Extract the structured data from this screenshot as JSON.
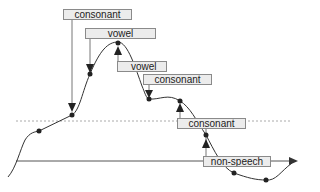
{
  "diagram": {
    "type": "pitch contour with segment labels",
    "labels": [
      {
        "text": "consonant",
        "x": 63,
        "y": 9,
        "w": 69
      },
      {
        "text": "vowel",
        "x": 85,
        "y": 28,
        "w": 71
      },
      {
        "text": "vowel",
        "x": 117,
        "y": 61,
        "w": 50
      },
      {
        "text": "consonant",
        "x": 143,
        "y": 74,
        "w": 69
      },
      {
        "text": "consonant",
        "x": 177,
        "y": 118,
        "w": 69
      },
      {
        "text": "non-speech",
        "x": 203,
        "y": 156,
        "w": 68
      }
    ],
    "colors": {
      "curve": "#333333",
      "box_fill": "#ececec",
      "box_border": "#8a8a8a",
      "dashed_line": "#aaaaaa",
      "axis": "#555555"
    }
  }
}
